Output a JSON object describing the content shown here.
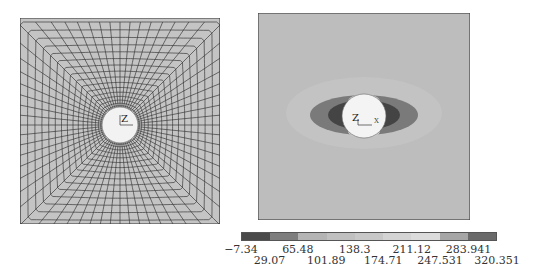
{
  "figure": {
    "left_panel": {
      "type": "finite-element-mesh",
      "description": "Square plate mesh with central circular hole, radial quadrilateral elements",
      "axis_label": "Z",
      "background_color": "#c4c4c4",
      "line_color": "#3a3a3a",
      "hole_color": "#f2f2f2"
    },
    "right_panel": {
      "type": "stress-contour",
      "description": "Contour plot of stress around central hole in square plate",
      "axis_labels": [
        "Z",
        "X"
      ],
      "background_color": "#bdbdbd",
      "hole_color": "#f4f4f4"
    },
    "colorbar": {
      "segments": [
        "#4a4a4a",
        "#7e7e7e",
        "#b4b4b4",
        "#c0c0c0",
        "#c8c8c8",
        "#d4d4d4",
        "#dcdcdc",
        "#a6a6a6",
        "#6a6a6a"
      ],
      "labels_upper": [
        "−7.34",
        "65.48",
        "138.3",
        "211.12",
        "283.941"
      ],
      "labels_lower": [
        "29.07",
        "101.89",
        "174.71",
        "247.531",
        "320.351"
      ]
    }
  },
  "chart_data": {
    "type": "heatmap",
    "title": "",
    "colorbar_ticks": [
      -7.34,
      29.07,
      65.48,
      101.89,
      138.3,
      174.71,
      211.12,
      247.531,
      283.941,
      320.351
    ],
    "colorbar_range": [
      -7.34,
      320.351
    ],
    "panels": [
      "FE mesh of plate with hole",
      "Stress contour around hole"
    ]
  }
}
